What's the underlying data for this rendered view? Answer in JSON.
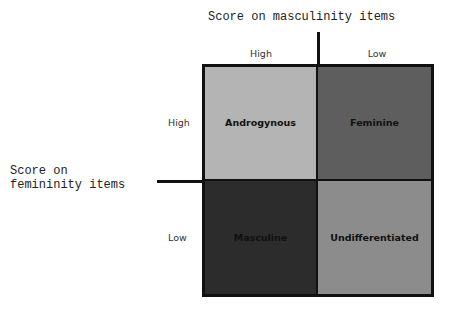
{
  "x_axis": {
    "title": "Score on masculinity items",
    "columns": [
      "High",
      "Low"
    ]
  },
  "y_axis": {
    "title": "Score on\nfemininity items",
    "rows": [
      "High",
      "Low"
    ]
  },
  "cells": [
    {
      "label": "Androgynous",
      "color": "#b4b4b4"
    },
    {
      "label": "Feminine",
      "color": "#5e5e5e"
    },
    {
      "label": "Masculine",
      "color": "#2c2c2c"
    },
    {
      "label": "Undifferentiated",
      "color": "#8c8c8c"
    }
  ]
}
